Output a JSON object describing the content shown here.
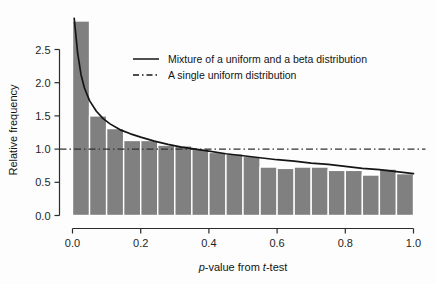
{
  "chart_data": {
    "type": "bar",
    "title": "",
    "subtitle": "",
    "xlabel": "p-value from t-test",
    "xlabel_parts": {
      "italic_1": "p",
      "mid": "-value from ",
      "italic_2": "t",
      "end": "-test"
    },
    "ylabel": "Relative frequency",
    "xlim": [
      0.0,
      1.0
    ],
    "ylim": [
      0.0,
      2.95
    ],
    "grid": false,
    "bin_width": 0.05,
    "categories": [
      "0.00-0.05",
      "0.05-0.10",
      "0.10-0.15",
      "0.15-0.20",
      "0.20-0.25",
      "0.25-0.30",
      "0.30-0.35",
      "0.35-0.40",
      "0.40-0.45",
      "0.45-0.50",
      "0.50-0.55",
      "0.55-0.60",
      "0.60-0.65",
      "0.65-0.70",
      "0.70-0.75",
      "0.75-0.80",
      "0.80-0.85",
      "0.85-0.90",
      "0.90-0.95",
      "0.95-1.00"
    ],
    "bin_centers": [
      0.025,
      0.075,
      0.125,
      0.175,
      0.225,
      0.275,
      0.325,
      0.375,
      0.425,
      0.475,
      0.525,
      0.575,
      0.625,
      0.675,
      0.725,
      0.775,
      0.825,
      0.875,
      0.925,
      0.975
    ],
    "values": [
      2.93,
      1.5,
      1.31,
      1.13,
      1.13,
      1.06,
      1.05,
      1.0,
      0.95,
      0.93,
      0.89,
      0.73,
      0.71,
      0.73,
      0.73,
      0.68,
      0.68,
      0.61,
      0.7,
      0.63
    ],
    "bar_color": "#808080",
    "bar_edge_color": "#ffffff",
    "xticks": [
      0.0,
      0.2,
      0.4,
      0.6,
      0.8,
      1.0
    ],
    "xtick_labels": [
      "0.0",
      "0.2",
      "0.4",
      "0.6",
      "0.8",
      "1.0"
    ],
    "yticks": [
      0.0,
      0.5,
      1.0,
      1.5,
      2.0,
      2.5
    ],
    "ytick_labels": [
      "0.0",
      "0.5",
      "1.0",
      "1.5",
      "2.0",
      "2.5"
    ],
    "legend_position": "upper-center",
    "series": [
      {
        "name": "Mixture of a uniform and a beta distribution",
        "type": "line",
        "style": "solid",
        "color": "#151515",
        "model": "mixture-uniform-beta",
        "x": [
          0.005,
          0.015,
          0.025,
          0.035,
          0.05,
          0.07,
          0.09,
          0.11,
          0.14,
          0.17,
          0.2,
          0.24,
          0.28,
          0.32,
          0.36,
          0.4,
          0.45,
          0.5,
          0.55,
          0.6,
          0.65,
          0.7,
          0.75,
          0.8,
          0.85,
          0.9,
          0.95,
          1.0
        ],
        "y": [
          2.97,
          2.45,
          2.12,
          1.92,
          1.73,
          1.57,
          1.46,
          1.38,
          1.29,
          1.23,
          1.18,
          1.12,
          1.07,
          1.03,
          1.0,
          0.97,
          0.93,
          0.9,
          0.87,
          0.84,
          0.82,
          0.79,
          0.77,
          0.74,
          0.71,
          0.69,
          0.66,
          0.63
        ]
      },
      {
        "name": "A single uniform distribution",
        "type": "line",
        "style": "dashdot",
        "color": "#303030",
        "constant_y": 1.0
      }
    ]
  },
  "legend": {
    "entries": [
      {
        "label": "Mixture of a uniform and a beta distribution",
        "style": "solid"
      },
      {
        "label": "A single uniform distribution",
        "style": "dashdot"
      }
    ]
  },
  "axes": {
    "x_title": "p-value from t-test",
    "y_title": "Relative frequency"
  }
}
